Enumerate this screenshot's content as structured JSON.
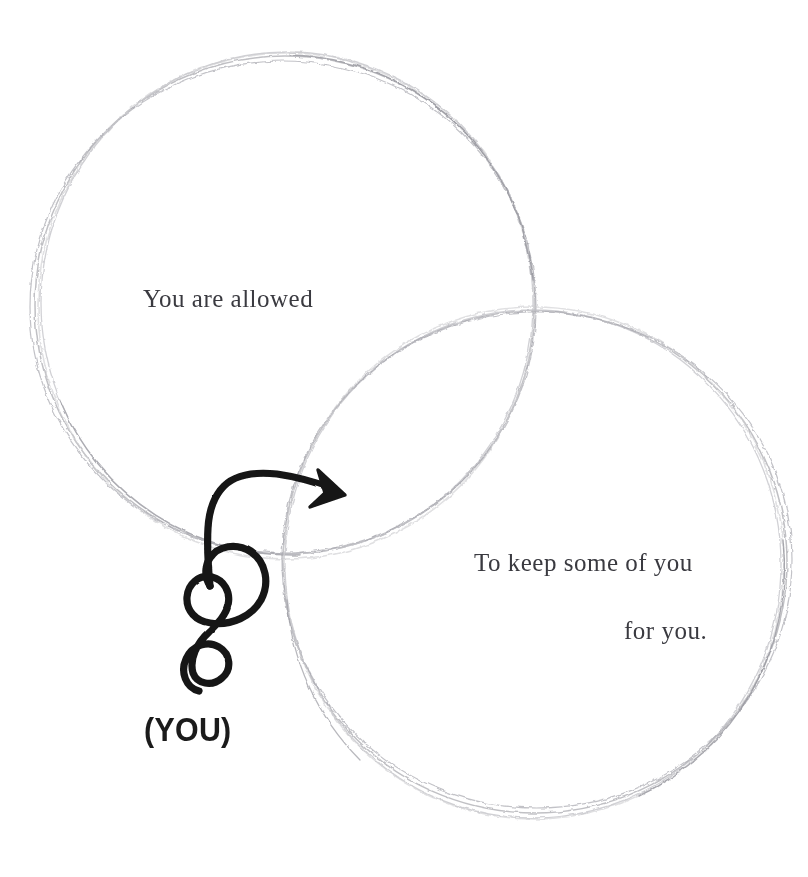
{
  "canvas": {
    "width": 808,
    "height": 877,
    "background_color": "#ffffff"
  },
  "diagram": {
    "type": "venn-two-circle",
    "style": "hand-drawn pencil sketch, multi-pass faint strokes",
    "stroke_color": "#b9b9bd",
    "stroke_color_dark": "#9a9aa0",
    "circles": [
      {
        "id": "left-circle",
        "name": "You are allowed",
        "cx": 285,
        "cy": 305,
        "r": 250,
        "passes": 3
      },
      {
        "id": "right-circle",
        "name": "To keep some of you for you.",
        "cx": 535,
        "cy": 562,
        "r": 252,
        "passes": 3
      }
    ],
    "intersections": [
      {
        "x": 505,
        "y": 310
      },
      {
        "x": 290,
        "y": 560
      }
    ]
  },
  "labels": {
    "left": "You are allowed",
    "right_line_1": "To keep some of you",
    "right_line_2": "for you.",
    "you_marker": "(YOU)",
    "text_color": "#3a3a40",
    "marker_color": "#1b1b1b"
  },
  "annotation": {
    "arrow": {
      "name": "curly-arrow",
      "color": "#111111",
      "stroke_width": 7,
      "description": "hand-drawn squiggle with two loops rising from bottom-left, arcing right into an arrowhead pointing into the overlap region",
      "tail_start": {
        "x": 198,
        "y": 690
      },
      "arrow_tip": {
        "x": 343,
        "y": 497
      },
      "loops": 2
    }
  }
}
